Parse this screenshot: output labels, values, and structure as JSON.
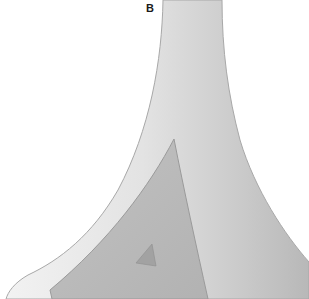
{
  "figure": {
    "panel_label": "B",
    "colors": {
      "background": "#ffffff",
      "outer_shape_light": "#e6e6e6",
      "outer_shape_mid": "#cfcfcf",
      "outer_shape_edge": "#a8a8a8",
      "inner_region": "#b9b9b9",
      "inner_region_edge": "#9a9a9a",
      "small_mark": "#a2a2a2"
    },
    "shapes": [
      {
        "name": "outer-flared-structure",
        "description": "tall funnel/trumpet shape widening toward bottom"
      },
      {
        "name": "inner-triangular-region",
        "description": "darker triangular area on lower-left"
      },
      {
        "name": "small-triangle-mark",
        "description": "small dark triangle inside inner region"
      }
    ]
  }
}
